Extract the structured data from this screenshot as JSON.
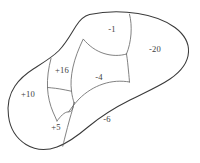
{
  "diagram": {
    "type": "region-partition-blob",
    "title": "",
    "stroke_color_outline": "#3a3a3a",
    "stroke_color_divider": "#6b6b6b",
    "background_color": "#ffffff",
    "label_color": "#3d3d3d",
    "regions": [
      {
        "id": "region-plus-10",
        "label": "+10",
        "value": 10,
        "sign": "positive",
        "position": "left",
        "label_x": 28,
        "label_y": 95
      },
      {
        "id": "region-plus-16",
        "label": "+16",
        "value": 16,
        "sign": "positive",
        "position": "upper-left-center",
        "label_x": 62,
        "label_y": 71
      },
      {
        "id": "region-minus-1",
        "label": "-1",
        "value": -1,
        "sign": "negative",
        "position": "top-center",
        "label_x": 112,
        "label_y": 30
      },
      {
        "id": "region-minus-4",
        "label": "-4",
        "value": -4,
        "sign": "negative",
        "position": "center",
        "label_x": 99,
        "label_y": 78
      },
      {
        "id": "region-minus-20",
        "label": "-20",
        "value": -20,
        "sign": "negative",
        "position": "right",
        "label_x": 155,
        "label_y": 50
      },
      {
        "id": "region-plus-5",
        "label": "+5",
        "value": 5,
        "sign": "positive",
        "position": "bottom-left",
        "label_x": 56,
        "label_y": 128
      },
      {
        "id": "region-minus-6",
        "label": "-6",
        "value": -6,
        "sign": "negative",
        "position": "bottom-center",
        "label_x": 107,
        "label_y": 120
      }
    ]
  }
}
